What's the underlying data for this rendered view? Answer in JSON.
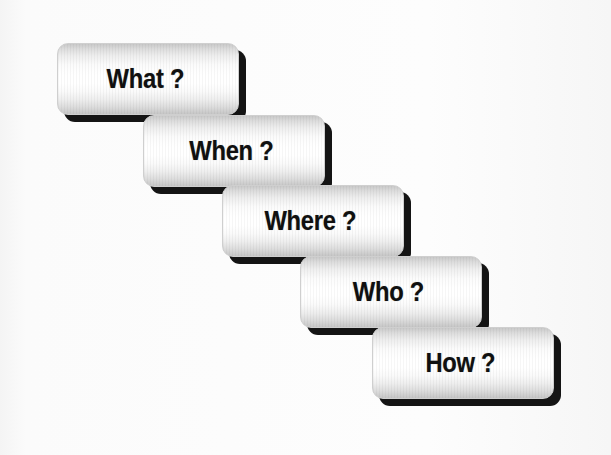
{
  "figure": {
    "background_color": "#f9f9f9",
    "button_face_color": "#ffffff",
    "button_edge_color": "#c6c6c6",
    "shadow_color": "#141414",
    "text_color": "#101010"
  },
  "steps": [
    {
      "label": "What ?",
      "order": 1,
      "x": 57,
      "y": 43,
      "width": 182,
      "height": 72
    },
    {
      "label": "When ?",
      "order": 2,
      "x": 143,
      "y": 115,
      "width": 182,
      "height": 72
    },
    {
      "label": "Where ?",
      "order": 3,
      "x": 222,
      "y": 185,
      "width": 182,
      "height": 72
    },
    {
      "label": "Who ?",
      "order": 4,
      "x": 300,
      "y": 256,
      "width": 182,
      "height": 72
    },
    {
      "label": "How ?",
      "order": 5,
      "x": 372,
      "y": 327,
      "width": 182,
      "height": 72
    }
  ]
}
